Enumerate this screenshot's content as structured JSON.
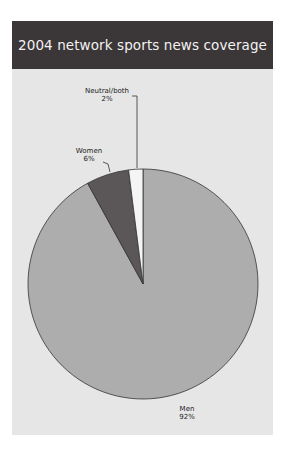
{
  "title": "2004 network sports news coverage",
  "chart_data": {
    "type": "pie",
    "title": "2004 network sports news coverage",
    "categories": [
      "Men",
      "Women",
      "Neutral/both"
    ],
    "values": [
      92,
      6,
      2
    ],
    "unit": "%",
    "colors": {
      "Men": "#adadad",
      "Women": "#5b5657",
      "Neutral/both": "#f5f5f5"
    },
    "labels": [
      {
        "name": "Men",
        "pct": "92%"
      },
      {
        "name": "Women",
        "pct": "6%"
      },
      {
        "name": "Neutral/both",
        "pct": "2%"
      }
    ],
    "start_angle": "12 o'clock, clockwise: Men, Women, Neutral/both",
    "legend": "none (direct labels)"
  },
  "colors": {
    "header_bg": "#3b3637",
    "panel_bg": "#e6e6e6",
    "men": "#adadad",
    "women": "#5b5657",
    "neutral": "#f5f5f5"
  }
}
